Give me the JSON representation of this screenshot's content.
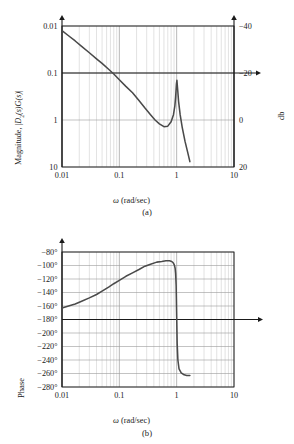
{
  "figures": [
    {
      "id": "a",
      "caption": "(a)",
      "xlabel_symbol": "ω",
      "xlabel_text": " (rad/sec)",
      "ylabel_prefix": "Magnitude, |",
      "ylabel_sym1": "D",
      "ylabel_sub1": "2",
      "ylabel_mid": "(s)",
      "ylabel_sym2": "G",
      "ylabel_mid2": "(s)",
      "ylabel_suffix": "|",
      "right_label": "db",
      "xticks": [
        "0.01",
        "0.1",
        "1",
        "10"
      ],
      "yticks": [
        "10",
        "1",
        "0.1",
        "0.01"
      ],
      "yticks_right": [
        "20",
        "0",
        "-20",
        "-40"
      ],
      "chart_data": {
        "type": "line",
        "title": "",
        "xlabel": "ω (rad/sec)",
        "ylabel": "Magnitude, |D2(s)G(s)|",
        "ylabel_right": "db",
        "xscale": "log",
        "yscale": "log",
        "xlim": [
          0.01,
          10
        ],
        "ylim": [
          0.01,
          10
        ],
        "xticks": [
          0.01,
          0.1,
          1,
          10
        ],
        "yticks": [
          0.01,
          0.1,
          1,
          10
        ],
        "yticks_right_db": [
          -40,
          -20,
          0,
          20
        ],
        "grid": "log-minor-vertical-and-major-horizontal",
        "legend": "none",
        "annotations": [
          "0 db line extends right with arrowhead",
          "vertical axis has arrowhead at top"
        ],
        "series": [
          {
            "name": "|D2(s)G(s)|",
            "color": "#4a4a4a",
            "x": [
              0.01,
              0.013,
              0.017,
              0.022,
              0.03,
              0.04,
              0.05,
              0.065,
              0.08,
              0.1,
              0.13,
              0.17,
              0.22,
              0.28,
              0.35,
              0.42,
              0.5,
              0.6,
              0.7,
              0.8,
              0.88,
              0.93,
              0.96,
              0.99,
              1.01,
              1.04,
              1.08,
              1.15,
              1.25,
              1.4,
              1.55,
              1.7
            ],
            "y": [
              8.0,
              6.2,
              4.8,
              3.7,
              2.7,
              2.0,
              1.6,
              1.2,
              0.95,
              0.72,
              0.52,
              0.38,
              0.26,
              0.18,
              0.13,
              0.1,
              0.083,
              0.072,
              0.074,
              0.092,
              0.13,
              0.2,
              0.31,
              0.58,
              0.7,
              0.45,
              0.25,
              0.13,
              0.07,
              0.035,
              0.021,
              0.013
            ]
          }
        ]
      }
    },
    {
      "id": "b",
      "caption": "(b)",
      "xlabel_symbol": "ω",
      "xlabel_text": " (rad/sec)",
      "ylabel": "Phase",
      "xticks": [
        "0.01",
        "0.1",
        "1",
        "10"
      ],
      "yticks": [
        "-80°",
        "-100°",
        "-120°",
        "-140°",
        "-160°",
        "-180°",
        "-200°",
        "-220°",
        "-240°",
        "-260°",
        "-280°"
      ],
      "chart_data": {
        "type": "line",
        "title": "",
        "xlabel": "ω (rad/sec)",
        "ylabel": "Phase",
        "xscale": "log",
        "yscale": "linear",
        "xlim": [
          0.01,
          10
        ],
        "ylim": [
          -280,
          -80
        ],
        "xticks": [
          0.01,
          0.1,
          1,
          10
        ],
        "yticks": [
          -80,
          -100,
          -120,
          -140,
          -160,
          -180,
          -200,
          -220,
          -240,
          -260,
          -280
        ],
        "grid": "log-minor-vertical-and-major-horizontal",
        "legend": "none",
        "annotations": [
          "-180 deg line extends right with arrowhead",
          "vertical axis has arrowhead at top"
        ],
        "series": [
          {
            "name": "phase of D2(s)G(s)",
            "color": "#4a4a4a",
            "x": [
              0.01,
              0.013,
              0.017,
              0.022,
              0.03,
              0.04,
              0.05,
              0.065,
              0.08,
              0.1,
              0.13,
              0.17,
              0.22,
              0.28,
              0.35,
              0.45,
              0.55,
              0.65,
              0.75,
              0.82,
              0.87,
              0.91,
              0.94,
              0.96,
              0.98,
              1.0,
              1.02,
              1.05,
              1.1,
              1.2,
              1.35,
              1.5,
              1.7
            ],
            "y": [
              -163,
              -160,
              -157,
              -153,
              -148,
              -143,
              -138,
              -132,
              -127,
              -122,
              -116,
              -111,
              -106,
              -101,
              -98,
              -95,
              -94,
              -93,
              -93,
              -94,
              -96,
              -99,
              -104,
              -112,
              -130,
              -175,
              -215,
              -240,
              -253,
              -259,
              -262,
              -263,
              -263
            ]
          }
        ]
      }
    }
  ],
  "colors": {
    "curve": "#4a4a4a",
    "axis": "#1a1a1a",
    "grid_minor": "#c9c9c9",
    "grid_major": "#9a9a9a",
    "background": "#ffffff"
  }
}
